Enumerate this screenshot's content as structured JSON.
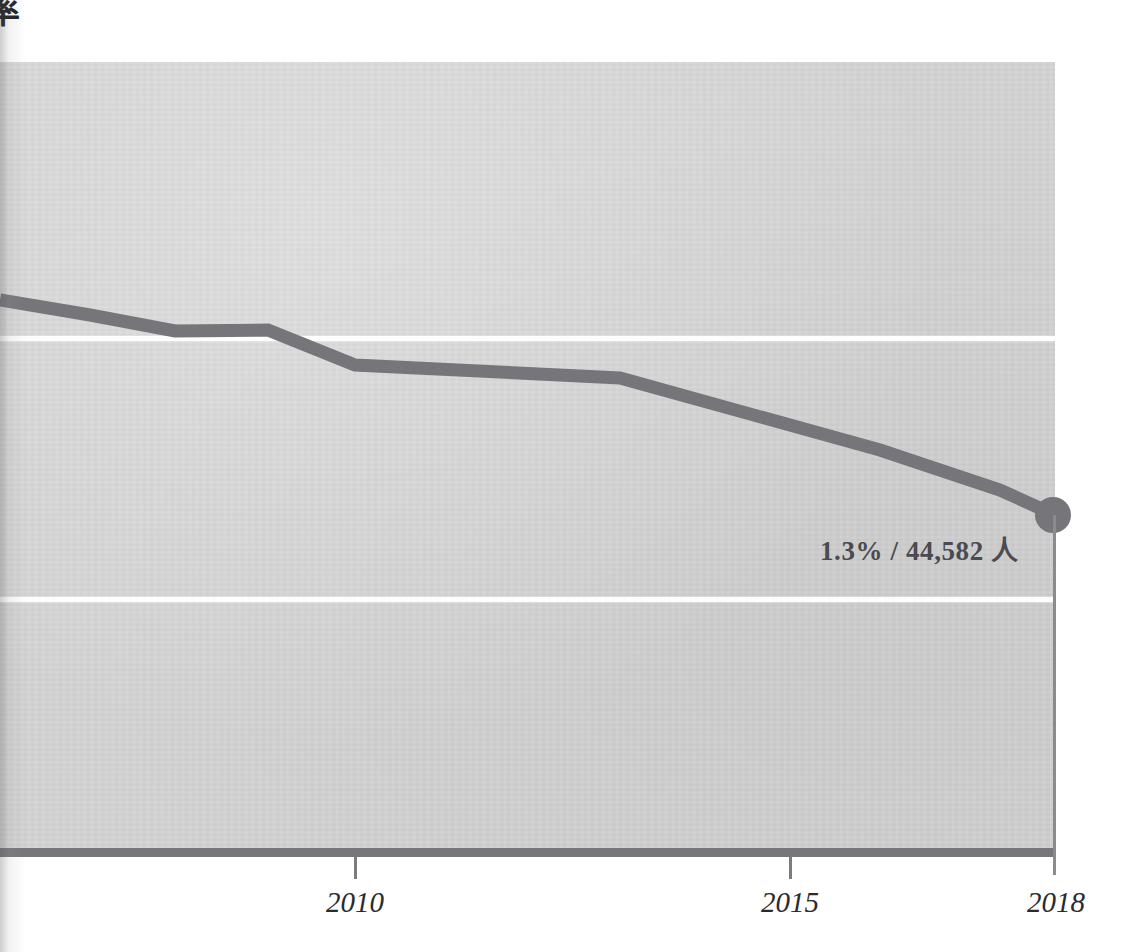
{
  "figure": {
    "y_axis_title_clipped": "率",
    "note_text": "1.3% / 44,582 人"
  },
  "colors": {
    "plot_background": "#d3d3d3",
    "page_background": "#ffffff",
    "series_line": "#76767a",
    "gridline": "#fdfdfd",
    "axis_bar": "#77777b",
    "label_text": "#2b2b2e",
    "callout_text": "#4b4b4f"
  },
  "axis": {
    "x_ticks": [
      {
        "label": "2010",
        "x": 355
      },
      {
        "label": "2015",
        "x": 790
      },
      {
        "label": "2018",
        "x": 1054
      }
    ]
  },
  "chart_data": {
    "type": "line",
    "title": "",
    "subtitle": "",
    "xlabel": "",
    "ylabel": "率",
    "grid": true,
    "legend_position": "none",
    "xlim": [
      2006.4,
      2018
    ],
    "ylim": [
      0.55,
      3.1
    ],
    "x_tick_labels": [
      "2010",
      "2015",
      "2018"
    ],
    "annotations": [
      {
        "text": "1.3% / 44,582 人",
        "x": 2018,
        "y": 1.3,
        "marker": "filled-circle"
      }
    ],
    "series": [
      {
        "name": "割合",
        "color": "#76767a",
        "x": [
          2006.4,
          2007.0,
          2008.0,
          2009.0,
          2010.0,
          2013.0,
          2016.0,
          2017.4,
          2018.0
        ],
        "values": [
          2.32,
          2.26,
          2.19,
          2.2,
          2.06,
          2.0,
          1.73,
          1.57,
          1.3
        ],
        "pixel_points": [
          {
            "x": 0,
            "y": 300
          },
          {
            "x": 90,
            "y": 315
          },
          {
            "x": 175,
            "y": 331
          },
          {
            "x": 268,
            "y": 330
          },
          {
            "x": 355,
            "y": 365
          },
          {
            "x": 620,
            "y": 378
          },
          {
            "x": 880,
            "y": 450
          },
          {
            "x": 1000,
            "y": 490
          },
          {
            "x": 1055,
            "y": 515
          }
        ]
      }
    ],
    "gridline_pixel_y": [
      336,
      597
    ]
  }
}
